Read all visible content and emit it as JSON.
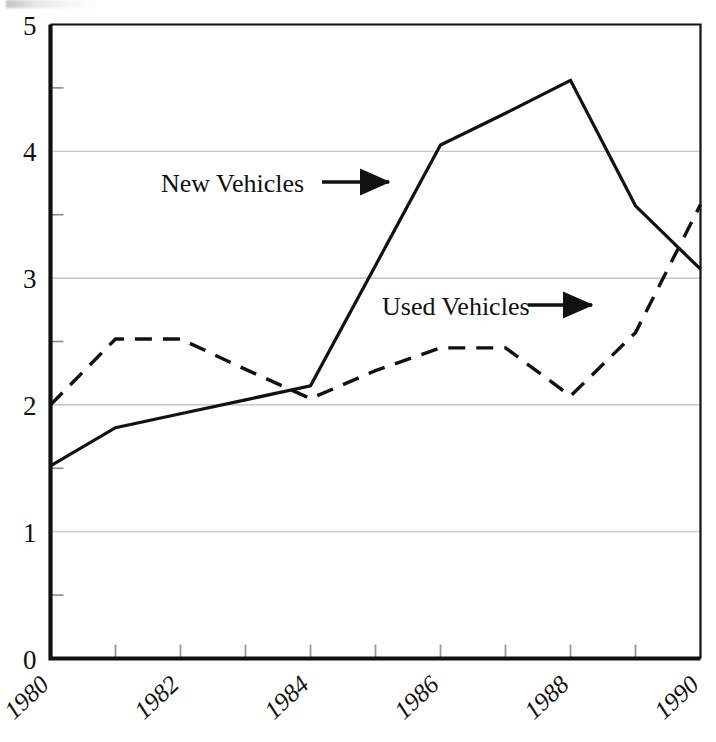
{
  "figure": {
    "background_color": "#fefefe",
    "frame_color": "#111111",
    "grid_color": "#b9b9b9"
  },
  "axes": {
    "y_label_0": "0",
    "y_label_1": "1",
    "y_label_2": "2",
    "y_label_3": "3",
    "y_label_4": "4",
    "y_label_5": "5",
    "x_label_1980": "1980",
    "x_label_1982": "1982",
    "x_label_1984": "1984",
    "x_label_1986": "1986",
    "x_label_1988": "1988",
    "x_label_1990": "1990"
  },
  "annotations": {
    "new_vehicles_label": "New Vehicles",
    "used_vehicles_label": "Used Vehicles"
  },
  "chart_data": {
    "type": "line",
    "title": "",
    "subtitle": "",
    "xlabel": "",
    "ylabel": "",
    "xlim": [
      1980,
      1990
    ],
    "ylim": [
      0,
      5
    ],
    "grid": true,
    "grid_axis": "y",
    "legend_position": "inline-annotations",
    "y_ticks_major": [
      0,
      1,
      2,
      3,
      4,
      5
    ],
    "y_ticks_minor": [
      0.5,
      1.5,
      2.5,
      3.5,
      4.5
    ],
    "x_ticks": [
      1980,
      1981,
      1982,
      1983,
      1984,
      1985,
      1986,
      1987,
      1988,
      1989,
      1990
    ],
    "x_tick_labels": [
      "1980",
      "",
      "1982",
      "",
      "1984",
      "",
      "1986",
      "",
      "1988",
      "",
      "1990"
    ],
    "x": [
      1980,
      1981,
      1982,
      1983,
      1984,
      1985,
      1986,
      1987,
      1988,
      1989,
      1990
    ],
    "series": [
      {
        "name": "New Vehicles",
        "style": "solid",
        "color": "#111111",
        "line_width": 3.2,
        "values": [
          1.52,
          1.82,
          1.93,
          2.04,
          2.15,
          3.1,
          4.05,
          4.3,
          4.56,
          3.57,
          3.07
        ]
      },
      {
        "name": "Used Vehicles",
        "style": "dashed",
        "color": "#111111",
        "line_width": 3.4,
        "values": [
          2.0,
          2.52,
          2.52,
          2.28,
          2.05,
          2.27,
          2.45,
          2.45,
          2.07,
          2.57,
          3.58
        ]
      }
    ]
  }
}
